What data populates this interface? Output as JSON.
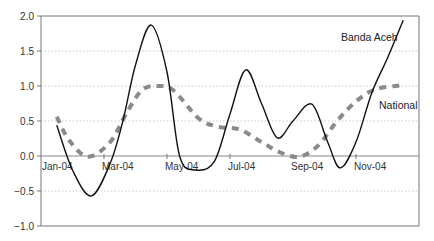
{
  "chart_data": {
    "type": "line",
    "title": "",
    "xlabel": "",
    "ylabel": "",
    "ylim": [
      -1.0,
      2.0
    ],
    "yticks": [
      2.0,
      1.5,
      1.0,
      0.5,
      0.0,
      -0.5,
      -1.0
    ],
    "ytick_labels": [
      "2.0",
      "1.5",
      "1.0",
      "0.5",
      "0.0",
      "−0.5",
      "−1.0"
    ],
    "x_tick_labels": [
      "Jan-04",
      "Mar-04",
      "May-04",
      "Jul-04",
      "Sep-04",
      "Nov-04"
    ],
    "grid": "horizontal dotted",
    "legend": "inline labels near line ends",
    "series": [
      {
        "name": "Banda Aceh",
        "style": "solid black",
        "color": "#111111",
        "points": [
          {
            "x": 0.5,
            "y": 0.44
          },
          {
            "x": 1.0,
            "y": -0.2
          },
          {
            "x": 1.6,
            "y": -0.57
          },
          {
            "x": 2.2,
            "y": -0.1
          },
          {
            "x": 2.6,
            "y": 0.5
          },
          {
            "x": 3.0,
            "y": 1.3
          },
          {
            "x": 3.5,
            "y": 1.87
          },
          {
            "x": 4.0,
            "y": 1.2
          },
          {
            "x": 4.4,
            "y": 0.0
          },
          {
            "x": 4.9,
            "y": -0.2
          },
          {
            "x": 5.5,
            "y": -0.08
          },
          {
            "x": 6.0,
            "y": 0.6
          },
          {
            "x": 6.5,
            "y": 1.23
          },
          {
            "x": 7.0,
            "y": 0.75
          },
          {
            "x": 7.5,
            "y": 0.26
          },
          {
            "x": 8.0,
            "y": 0.5
          },
          {
            "x": 8.6,
            "y": 0.74
          },
          {
            "x": 9.1,
            "y": 0.2
          },
          {
            "x": 9.5,
            "y": -0.17
          },
          {
            "x": 10.0,
            "y": 0.2
          },
          {
            "x": 10.5,
            "y": 0.9
          },
          {
            "x": 11.0,
            "y": 1.4
          },
          {
            "x": 11.5,
            "y": 1.94
          }
        ]
      },
      {
        "name": "National",
        "style": "thick dashed grey",
        "color": "#8a8a8a",
        "points": [
          {
            "x": 0.5,
            "y": 0.56
          },
          {
            "x": 0.9,
            "y": 0.22
          },
          {
            "x": 1.5,
            "y": -0.01
          },
          {
            "x": 2.2,
            "y": 0.2
          },
          {
            "x": 2.7,
            "y": 0.6
          },
          {
            "x": 3.2,
            "y": 0.94
          },
          {
            "x": 3.7,
            "y": 1.0
          },
          {
            "x": 4.2,
            "y": 0.94
          },
          {
            "x": 5.0,
            "y": 0.54
          },
          {
            "x": 5.6,
            "y": 0.42
          },
          {
            "x": 6.3,
            "y": 0.38
          },
          {
            "x": 7.0,
            "y": 0.2
          },
          {
            "x": 7.6,
            "y": 0.05
          },
          {
            "x": 8.2,
            "y": -0.01
          },
          {
            "x": 8.8,
            "y": 0.15
          },
          {
            "x": 9.4,
            "y": 0.5
          },
          {
            "x": 10.0,
            "y": 0.78
          },
          {
            "x": 10.6,
            "y": 0.95
          },
          {
            "x": 11.4,
            "y": 1.01
          }
        ]
      }
    ],
    "annotations": [
      {
        "text": "Banda Aceh",
        "near": "end of solid line, upper right"
      },
      {
        "text": "National",
        "near": "end of dashed line, right"
      }
    ]
  },
  "labels": {
    "banda_aceh": "Banda Aceh",
    "national": "National"
  }
}
